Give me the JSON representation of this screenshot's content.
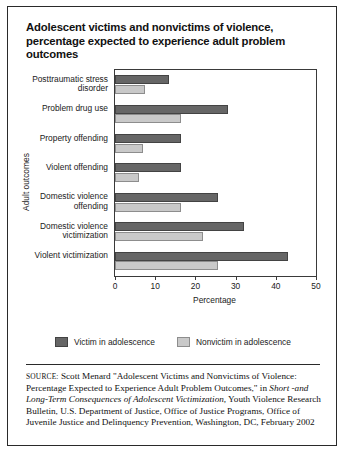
{
  "title": "Adolescent victims and nonvictims of violence, percentage expected to experience adult problem outcomes",
  "legend": {
    "victim_label": "Victim in adolescence",
    "nonvictim_label": "Nonvictim in adolescence",
    "victim_color": "#666666",
    "nonvictim_color": "#c9c9c9"
  },
  "source": {
    "label": "SOURCE:",
    "part1": " Scott Menard \"Adolescent Victims and Nonvictims of Violence: Percentage Expected to Experience Adult Problem Outcomes,\" in ",
    "italic1": "Short -and Long-Term Consequences of Adolescent Victimization,",
    "part2": " Youth Violence Research Bulletin, U.S. Department of Justice, Office of Justice Programs, Office of Juvenile Justice and Delinquency Prevention, Washington, DC, February 2002"
  },
  "chart_data": {
    "type": "bar",
    "orientation": "horizontal",
    "title": "Adolescent victims and nonvictims of violence, percentage expected to experience adult problem outcomes",
    "xlabel": "Percentage",
    "ylabel": "Adult outcomes",
    "xlim": [
      0,
      50
    ],
    "xticks": [
      0,
      10,
      20,
      30,
      40,
      50
    ],
    "grid": false,
    "legend_position": "bottom",
    "categories": [
      "Posttraumatic stress disorder",
      "Problem drug use",
      "Property offending",
      "Violent offending",
      "Domestic violence offending",
      "Domestic violence victimization",
      "Violent victimization"
    ],
    "series": [
      {
        "name": "Victim in adolescence",
        "color": "#666666",
        "values": [
          13.5,
          28,
          16.5,
          16.5,
          25.5,
          32,
          43
        ]
      },
      {
        "name": "Nonvictim in adolescence",
        "color": "#c9c9c9",
        "values": [
          7.5,
          16.5,
          7,
          6,
          16.5,
          22,
          25.5
        ]
      }
    ]
  }
}
